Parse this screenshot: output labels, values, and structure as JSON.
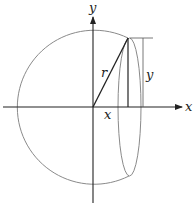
{
  "diagram": {
    "type": "sphere-cross-section",
    "labels": {
      "y_axis": "y",
      "x_axis": "x",
      "radius": "r",
      "x_distance": "x",
      "y_height": "y"
    },
    "colors": {
      "axis": "#222222",
      "circle": "#8a8a8a",
      "line": "#222222"
    }
  }
}
